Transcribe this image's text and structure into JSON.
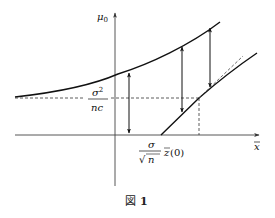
{
  "figure": {
    "caption": "図 1",
    "caption_prefix": "図",
    "caption_number": "1"
  },
  "axes": {
    "y_label": "μ₀",
    "y_label_base": "μ",
    "y_label_sub": "0",
    "x_label": "x̄",
    "x_label_base": "x",
    "x_label_bar": "‾"
  },
  "annotations": {
    "level_label_num": "σ",
    "level_label_num_sup": "2",
    "level_label_den": "nc",
    "threshold_label_num": "σ",
    "threshold_label_den_sqrt": "√",
    "threshold_label_den": "n",
    "threshold_label_func": "z̄(0)",
    "threshold_label_z": "z",
    "threshold_label_arg": "(0)"
  },
  "colors": {
    "stroke": "#111111",
    "axis": "#333333",
    "dash": "#333333",
    "background": "#ffffff"
  }
}
